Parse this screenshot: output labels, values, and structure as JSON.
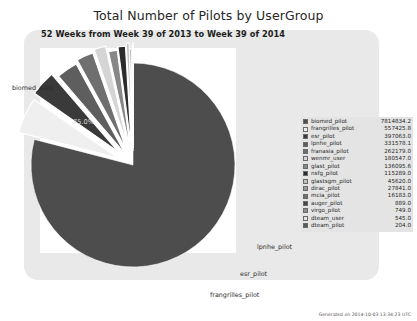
{
  "chart_data": {
    "type": "pie",
    "title": "Total Number of Pilots by UserGroup",
    "subtitle": "52 Weeks from Week 39 of 2013 to Week 39 of 2014",
    "categories": [
      "biomed_pilot",
      "frangrilles_pilot",
      "esr_pilot",
      "lpnhe_pilot",
      "franasia_pilot",
      "wenmr_user",
      "glast_pilot",
      "nsfg_pilot",
      "glastsgm_pilot",
      "dirac_pilot",
      "mcia_pilot",
      "auger_pilot",
      "virgo_pilot",
      "dteam_user",
      "dteam_pilot"
    ],
    "values": [
      7814834.2,
      557425.8,
      397063.0,
      331578.1,
      262179.0,
      180547.0,
      136095.6,
      115289.0,
      45620.0,
      27841.0,
      16183.0,
      889.0,
      749.0,
      545.0,
      204.0
    ],
    "value_labels": [
      "7814834.2",
      "557425.8",
      "397063.0",
      "331578.1",
      "262179.0",
      "180547.0",
      "136095.6",
      "115289.0",
      "45620.0",
      "27841.0",
      "16183.0",
      "889.0",
      "749.0",
      "545.0",
      "204.0"
    ],
    "colors": [
      "#4d4d4d",
      "#efefef",
      "#3a3a3a",
      "#5e5e5e",
      "#6f6f6f",
      "#d5d5d5",
      "#888888",
      "#2c2c2c",
      "#c2c2c2",
      "#9a9a9a",
      "#717171",
      "#454545",
      "#8d8d8d",
      "#e2e2e2",
      "#5a5a5a"
    ],
    "highlight_pct": "75.0%",
    "highlight_label": "biomed_pilot",
    "callout_labels": [
      "lpnhe_pilot",
      "esr_pilot",
      "frangrilles_pilot"
    ],
    "legend_position": "right",
    "grid": false,
    "xlabel": "",
    "ylabel": ""
  },
  "footer": {
    "generated": "Generated on 2014-10-03 13:34:23 UTC"
  }
}
